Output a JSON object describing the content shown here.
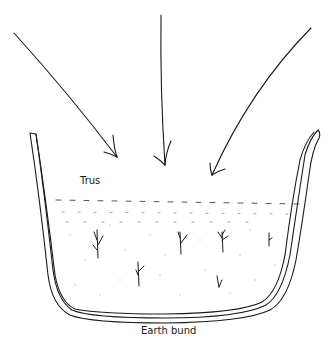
{
  "diagram": {
    "labels": {
      "top_inner": "Trus",
      "bottom": "Earth bund"
    },
    "elements": {
      "arrows": [
        {
          "name": "left-arrow",
          "direction": "down-right"
        },
        {
          "name": "center-arrow",
          "direction": "down"
        },
        {
          "name": "right-arrow",
          "direction": "down-left"
        }
      ],
      "container": "earth-bund-outline",
      "water_line": "dashed",
      "plants": 6
    },
    "colors": {
      "ink": "#1a1a1a",
      "background": "#ffffff",
      "dots": "#bbbbbb"
    }
  }
}
